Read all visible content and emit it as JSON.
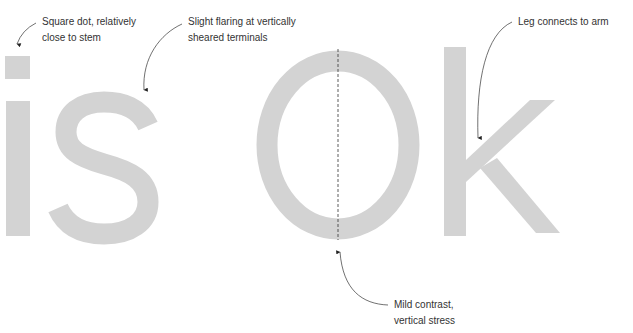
{
  "specimen": {
    "text": "is Ok",
    "glyph_color": "#d3d3d3",
    "annotation_color": "#333333"
  },
  "annotations": [
    {
      "id": "square-dot",
      "line1": "Square dot, relatively",
      "line2": "close to stem"
    },
    {
      "id": "flaring-terminals",
      "line1": "Slight flaring at vertically",
      "line2": "sheared terminals"
    },
    {
      "id": "leg-arm",
      "line1": "Leg connects to arm",
      "line2": ""
    },
    {
      "id": "contrast-stress",
      "line1": "Mild contrast,",
      "line2": "vertical stress"
    }
  ]
}
